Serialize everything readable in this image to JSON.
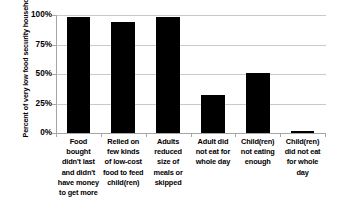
{
  "chart_data": {
    "type": "bar",
    "title": "",
    "xlabel": "",
    "ylabel": "Percent of very low food security households",
    "ylim": [
      0,
      100
    ],
    "ytick_labels": [
      "100%",
      "75%",
      "50%",
      "25%",
      "0%"
    ],
    "ytick_values": [
      100,
      75,
      50,
      25,
      0
    ],
    "grid": true,
    "legend": "none",
    "bar_color": "#000000",
    "gridline_color": "#c9c9c9",
    "axis_color": "#a6a6a6",
    "background_color": "#ffffff",
    "categories": [
      "Food bought didn't last and didn't have money to get more",
      "Relied on few kinds of low-cost food to feed child(ren)",
      "Adults reduced size of meals or skipped",
      "Adult did not eat for whole day",
      "Child(ren) not eating enough",
      "Child(ren) did not eat for whole day"
    ],
    "category_lines": [
      [
        "Food",
        "bought",
        "didn't last",
        "and didn't",
        "have money",
        "to get more"
      ],
      [
        "Relied on",
        "few kinds",
        "of low-cost",
        "food to feed",
        "child(ren)"
      ],
      [
        "Adults",
        "reduced",
        "size of",
        "meals or",
        "skipped"
      ],
      [
        "Adult did",
        "not eat for",
        "whole day"
      ],
      [
        "Child(ren)",
        "not eating",
        "enough"
      ],
      [
        "Child(ren)",
        "did not eat",
        "for whole",
        "day"
      ]
    ],
    "values": [
      98,
      94,
      98,
      32,
      51,
      2
    ]
  }
}
